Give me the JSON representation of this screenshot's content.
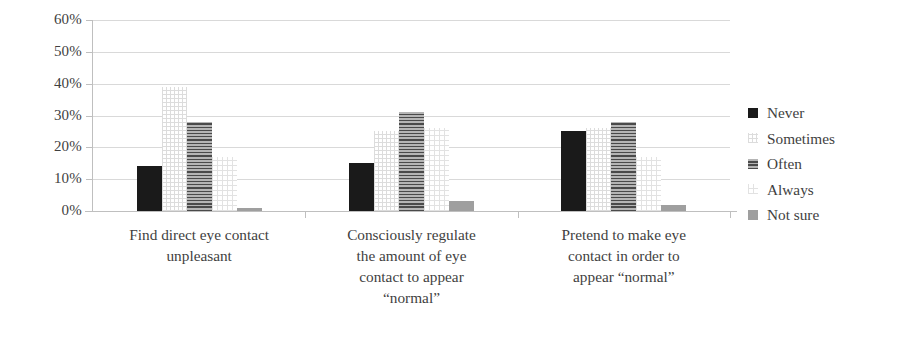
{
  "chart_data": {
    "type": "bar",
    "title": "",
    "xlabel": "",
    "ylabel": "",
    "ylim": [
      0,
      60
    ],
    "ytick_labels": [
      "60%",
      "50%",
      "40%",
      "30%",
      "20%",
      "10%",
      "0%"
    ],
    "ytick_values": [
      60,
      50,
      40,
      30,
      20,
      10,
      0
    ],
    "grid": true,
    "legend_position": "right",
    "categories": [
      "Find direct eye contact\nunpleasant",
      "Consciously regulate\nthe amount of eye\ncontact to appear\n“normal”",
      "Pretend to make eye\ncontact in order to\nappear “normal”"
    ],
    "series": [
      {
        "name": "Never",
        "pattern": "solid-black",
        "color": "#1a1a1a",
        "values": [
          14,
          15,
          25
        ]
      },
      {
        "name": "Sometimes",
        "pattern": "light-dotted",
        "color": "#dcdcdc",
        "values": [
          39,
          25,
          26
        ]
      },
      {
        "name": "Often",
        "pattern": "horizontal-lines",
        "color": "#6e6e6e",
        "values": [
          28,
          31,
          28
        ]
      },
      {
        "name": "Always",
        "pattern": "light-grid",
        "color": "#e2e2e2",
        "values": [
          17,
          26,
          17
        ]
      },
      {
        "name": "Not sure",
        "pattern": "solid-gray",
        "color": "#9f9f9f",
        "values": [
          1,
          3,
          2
        ]
      }
    ]
  },
  "legend": {
    "items": [
      {
        "label": "Never"
      },
      {
        "label": "Sometimes"
      },
      {
        "label": "Often"
      },
      {
        "label": "Always"
      },
      {
        "label": "Not sure"
      }
    ]
  }
}
